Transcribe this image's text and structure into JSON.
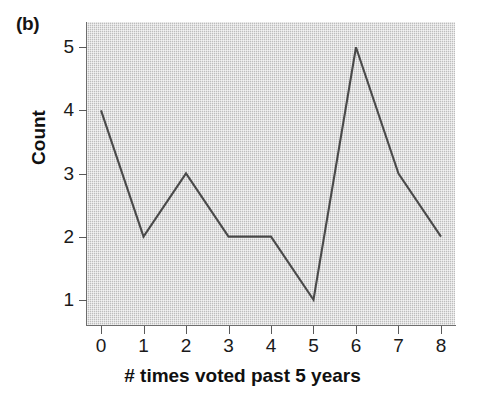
{
  "panel": {
    "label": "(b)"
  },
  "chart_data": {
    "type": "line",
    "title": "",
    "subtitle": "",
    "panel_label": "(b)",
    "xlabel": "# times voted past 5 years",
    "ylabel": "Count",
    "x": [
      0,
      1,
      2,
      3,
      4,
      5,
      6,
      7,
      8
    ],
    "values": [
      4,
      2,
      3,
      2,
      2,
      1,
      5,
      3,
      2
    ],
    "series": [
      {
        "name": "Count",
        "values": [
          4,
          2,
          3,
          2,
          2,
          1,
          5,
          3,
          2
        ]
      }
    ],
    "xtick_labels": [
      "0",
      "1",
      "2",
      "3",
      "4",
      "5",
      "6",
      "7",
      "8"
    ],
    "ytick_labels": [
      "1",
      "2",
      "3",
      "4",
      "5"
    ],
    "ytick_values": [
      1,
      2,
      3,
      4,
      5
    ],
    "xlim": [
      -0.33,
      8.33
    ],
    "ylim": [
      0.6,
      5.4
    ],
    "grid": false,
    "legend": false,
    "legend_position": "none",
    "plot_background": "#c9c9c9",
    "line_color": "#4a4a4a",
    "annotations": []
  }
}
